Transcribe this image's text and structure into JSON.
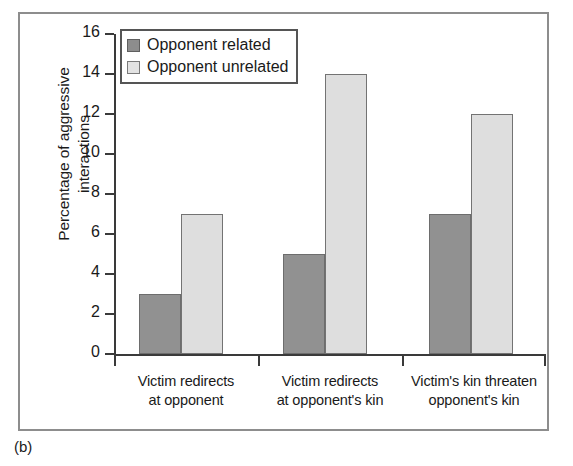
{
  "caption": "(b)",
  "chart_data": {
    "type": "bar",
    "title": "",
    "xlabel": "",
    "ylabel": "Percentage of aggressive interactions",
    "ylabel_lines": [
      "Percentage of aggressive",
      "interactions"
    ],
    "ylim": [
      0,
      16
    ],
    "yticks": [
      0,
      2,
      4,
      6,
      8,
      10,
      12,
      14,
      16
    ],
    "ytick_labels": [
      "0",
      "2",
      "4",
      "6",
      "8",
      "10",
      "12",
      "14",
      "16"
    ],
    "grid": false,
    "legend_position": "top-left-inside",
    "categories": [
      "Victim redirects at opponent",
      "Victim redirects at opponent's kin",
      "Victim's kin threaten opponent's kin"
    ],
    "category_lines": [
      [
        "Victim redirects",
        "at opponent"
      ],
      [
        "Victim redirects",
        "at opponent's kin"
      ],
      [
        "Victim's kin threaten",
        "opponent's kin"
      ]
    ],
    "series": [
      {
        "name": "Opponent related",
        "color": "#919191",
        "values": [
          3,
          5,
          7
        ]
      },
      {
        "name": "Opponent unrelated",
        "color": "#dedede",
        "values": [
          7,
          14,
          12
        ]
      }
    ]
  },
  "legend": {
    "items": [
      {
        "label": "Opponent related",
        "swatch": "related"
      },
      {
        "label": "Opponent unrelated",
        "swatch": "unrelated"
      }
    ]
  }
}
